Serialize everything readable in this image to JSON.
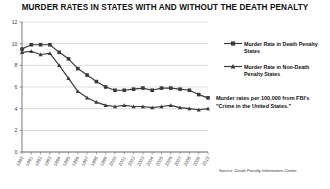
{
  "chart_data": {
    "type": "line",
    "title": "MURDER RATES IN STATES WITH AND WITHOUT THE DEATH PENALTY",
    "xlabel": "",
    "ylabel": "",
    "ylim": [
      0,
      12
    ],
    "yticks": [
      0,
      2,
      4,
      6,
      8,
      10,
      12
    ],
    "grid": true,
    "legend_position": "right",
    "categories": [
      "1990",
      "1991",
      "1992",
      "1993",
      "1994",
      "1995",
      "1996",
      "1997",
      "1998",
      "1999",
      "2000",
      "2001",
      "2002",
      "2003",
      "2004",
      "2005",
      "2006",
      "2007",
      "2008",
      "2009",
      "2010"
    ],
    "series": [
      {
        "name": "Murder Rate in Death Penalty States",
        "marker": "square",
        "color": "#3a3a3a",
        "values": [
          9.5,
          9.9,
          9.9,
          9.9,
          9.2,
          8.6,
          7.7,
          7.1,
          6.5,
          6.0,
          5.7,
          5.7,
          5.8,
          5.9,
          5.7,
          5.9,
          5.9,
          5.8,
          5.7,
          5.3,
          5.0
        ]
      },
      {
        "name": "Murder Rate in Non-Death Penalty States",
        "marker": "triangle",
        "color": "#3a3a3a",
        "values": [
          9.2,
          9.3,
          9.0,
          9.1,
          8.0,
          6.8,
          5.6,
          5.0,
          4.6,
          4.3,
          4.2,
          4.3,
          4.2,
          4.2,
          4.1,
          4.2,
          4.3,
          4.1,
          4.0,
          3.9,
          4.0
        ]
      }
    ],
    "annotation": "Murder rates per 100,000 from FBI's \"Crime in the United States.\"",
    "source": "Source: Death Penalty Information Center"
  },
  "legend": {
    "death_penalty_label": "Murder Rate in Death Penalty States",
    "non_death_penalty_label": "Murder Rate in Non-Death Penalty States"
  }
}
